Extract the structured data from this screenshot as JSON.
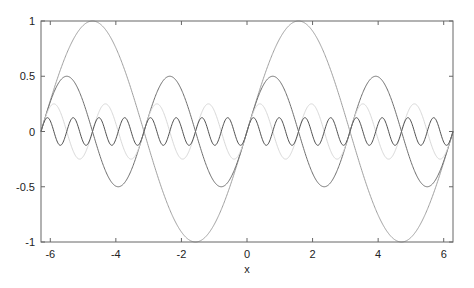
{
  "chart_data": {
    "type": "line",
    "title": "",
    "xlabel": "x",
    "ylabel": "",
    "xlim": [
      -6.2832,
      6.2832
    ],
    "ylim": [
      -1,
      1
    ],
    "grid": false,
    "legend": null,
    "xticks": [
      -6,
      -4,
      -2,
      0,
      2,
      4,
      6
    ],
    "xtick_labels": [
      "-6",
      "-4",
      "-2",
      "0",
      "2",
      "4",
      "6"
    ],
    "yticks": [
      -1,
      -0.5,
      0,
      0.5,
      1
    ],
    "ytick_labels": [
      "-1",
      "-0.5",
      "0",
      "0.5",
      "1"
    ],
    "series": [
      {
        "name": "sin(x)",
        "amplitude": 1,
        "frequency": 1,
        "color": "#a0a0a0"
      },
      {
        "name": "0.5 sin(2x)",
        "amplitude": 0.5,
        "frequency": 2,
        "color": "#6e6e6e"
      },
      {
        "name": "0.25 sin(4x)",
        "amplitude": 0.25,
        "frequency": 4,
        "color": "#d8d8d8"
      },
      {
        "name": "0.125 sin(8x)",
        "amplitude": 0.125,
        "frequency": 8,
        "color": "#505050"
      }
    ]
  }
}
